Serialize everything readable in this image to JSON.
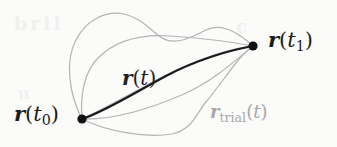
{
  "figure": {
    "kind": "variational-paths-diagram",
    "width": 337,
    "height": 147,
    "background_color": "#fbfbfa"
  },
  "colors": {
    "true_path": "#1a1a1a",
    "trial_path": "#b4b4b4",
    "endpoint_dot": "#111111",
    "true_label": "#1b1b1b",
    "trial_label": "#a8a8a8",
    "bleed_through": "#f0f0ee",
    "background": "#fbfbfa"
  },
  "endpoints": [
    {
      "id": "start",
      "label_text": "r(t0)",
      "x": 82,
      "y": 119,
      "dot_radius": 4.6
    },
    {
      "id": "end",
      "label_text": "r(t1)",
      "x": 253,
      "y": 46,
      "dot_radius": 4.6
    }
  ],
  "labels": {
    "start": {
      "vec": "r",
      "open": "(",
      "tvar": "t",
      "sub": "0",
      "close": ")"
    },
    "end": {
      "vec": "r",
      "open": "(",
      "tvar": "t",
      "sub": "1",
      "close": ")"
    },
    "true_path": {
      "vec": "r",
      "open": "(",
      "tvar": "t",
      "close": ")"
    },
    "trial_path": {
      "vec": "r",
      "sub_word": "trial",
      "open": "(",
      "tvar": "t",
      "close": ")"
    }
  },
  "paths": {
    "true": {
      "name": "r(t)",
      "style": "solid-dark",
      "stroke_width": 2.1,
      "d": "M 82 119 C 104 112 136 92 166 76 C 196 60 230 50 253 46"
    },
    "trials": [
      {
        "name": "trial-upper-outer",
        "d": "M 82 119 C 70 96 64 62 76 40 C 86 20 106 10 124 14 C 142 18 152 32 162 38 C 176 46 192 37 206 30 C 222 22 240 34 253 46",
        "stroke_width": 1.2
      },
      {
        "name": "trial-upper-inner",
        "d": "M 82 119 C 80 96 84 72 98 58 C 116 40 142 34 170 36 C 200 38 232 42 253 46",
        "stroke_width": 1.2
      },
      {
        "name": "trial-middle",
        "d": "M 82 119 C 106 108 140 88 172 72 C 202 58 232 48 253 46",
        "stroke_width": 1.2
      },
      {
        "name": "trial-lower-inner",
        "d": "M 82 119 C 116 120 152 108 184 94 C 212 82 236 60 253 46",
        "stroke_width": 1.2
      },
      {
        "name": "trial-lower-outer",
        "d": "M 82 119 C 108 132 146 138 172 134 C 192 130 196 114 206 102 C 216 90 230 70 240 58 C 246 52 250 48 253 46",
        "stroke_width": 1.2
      }
    ]
  },
  "bleed_through": [
    {
      "text": "bril",
      "x": 14,
      "y": 12,
      "size": 19,
      "rotate": -1
    },
    {
      "text": "c",
      "x": 236,
      "y": 16,
      "size": 18,
      "rotate": 0
    },
    {
      "text": "u",
      "x": 18,
      "y": 84,
      "size": 16,
      "rotate": 0
    }
  ]
}
